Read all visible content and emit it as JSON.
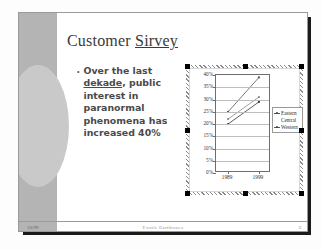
{
  "slide": {
    "title_prefix": "Customer ",
    "title_misspelled_word": "Sirvey",
    "bullet_dot": "•",
    "bullet_line1": "Over the last ",
    "bullet_misspelled_word": "dekade",
    "bullet_line2": ", public interest in paranormal phenomena has increased 40%"
  },
  "footer": {
    "date": "10/99",
    "center_text": "Exotic Earthtones",
    "page_number": "3"
  },
  "chart_data": {
    "type": "line",
    "title": "",
    "xlabel": "",
    "ylabel": "",
    "x": [
      "1989",
      "1999"
    ],
    "categories": [
      "1989",
      "1999"
    ],
    "series": [
      {
        "name": "Eastern",
        "values": [
          25,
          39
        ]
      },
      {
        "name": "Central",
        "values": [
          22,
          31
        ]
      },
      {
        "name": "Western",
        "values": [
          20,
          29
        ]
      }
    ],
    "ylim": [
      0,
      40
    ],
    "yticks": [
      0,
      5,
      10,
      15,
      20,
      25,
      30,
      35,
      40
    ],
    "ytick_labels": [
      "0%",
      "5%",
      "10%",
      "15%",
      "20%",
      "25%",
      "30%",
      "35%",
      "40%"
    ],
    "grid": true,
    "legend_position": "right",
    "legend_entries": [
      "Eastern",
      "Central",
      "Western"
    ],
    "series_colors": [
      "#555555",
      "#888888",
      "#333333"
    ]
  },
  "selection": {
    "handle_count": 8,
    "object_selected": true
  }
}
